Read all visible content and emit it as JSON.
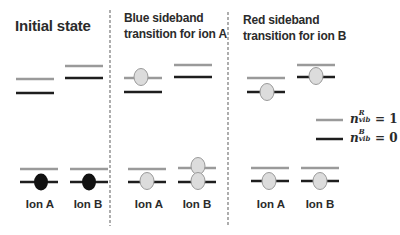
{
  "panels": [
    {
      "id": "initial",
      "title_lines": [
        "Initial state"
      ],
      "ion_labels": [
        "Ion A",
        "Ion B"
      ]
    },
    {
      "id": "blue-sideband",
      "title_lines": [
        "Blue sideband",
        "transition for ion A"
      ],
      "ion_labels": [
        "Ion A",
        "Ion B"
      ]
    },
    {
      "id": "red-sideband",
      "title_lines": [
        "Red sideband",
        "transition for ion B"
      ],
      "ion_labels": [
        "Ion A",
        "Ion B"
      ]
    }
  ],
  "legend": [
    {
      "line_color": "#9a9a9a",
      "symbol": "n",
      "superscript": "R",
      "subscript": "vib",
      "equals": "= 1"
    },
    {
      "line_color": "#1e1e1e",
      "symbol": "n",
      "superscript": "B",
      "subscript": "vib",
      "equals": "= 0"
    }
  ],
  "colors": {
    "excited_level": "#9a9a9a",
    "ground_level": "#1e1e1e",
    "ion_initial_fill": "#111111",
    "ion_transferred_fill": "#dcdcdc",
    "ion_outline": "#9a9a9a",
    "divider": "#9a9a9a",
    "text": "#2b2b2b"
  }
}
